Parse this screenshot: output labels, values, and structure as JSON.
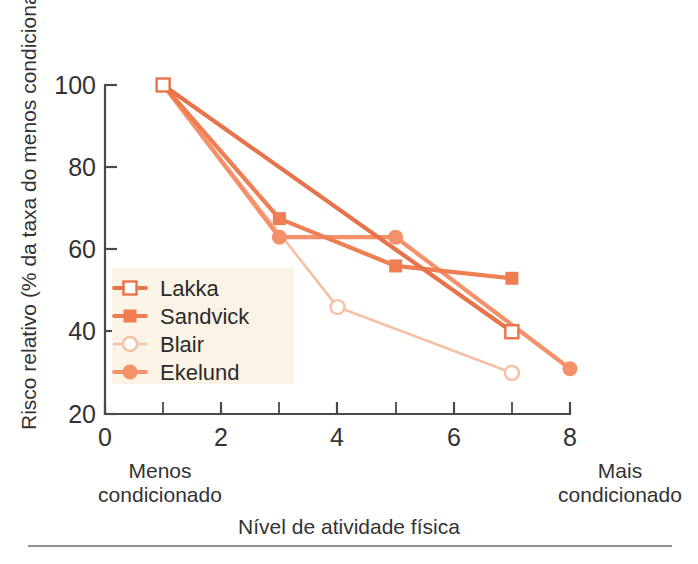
{
  "chart_data": {
    "type": "line",
    "title": "",
    "xlabel": "Nível de atividade física",
    "ylabel": "Risco relativo (% da taxa do menos condicionado)",
    "xlim": [
      0,
      8
    ],
    "ylim": [
      20,
      100
    ],
    "x_ticks": [
      0,
      2,
      4,
      6,
      8
    ],
    "x_tick_labels": [
      "0",
      "2",
      "4",
      "6",
      "8"
    ],
    "x_minor_ticks": [
      1,
      3,
      5,
      7
    ],
    "y_ticks": [
      20,
      40,
      60,
      80,
      100
    ],
    "y_tick_labels": [
      "20",
      "40",
      "60",
      "80",
      "100"
    ],
    "grid": false,
    "legend_position": "lower-left-inside",
    "x_axis_end_labels": {
      "left_line1": "Menos",
      "left_line2": "condicionado",
      "right_line1": "Mais",
      "right_line2": "condicionado"
    },
    "series": [
      {
        "name": "Lakka",
        "marker": "open-square",
        "color": "#e8734a",
        "x": [
          1,
          7
        ],
        "y": [
          100,
          40
        ]
      },
      {
        "name": "Sandvick",
        "marker": "filled-square",
        "color": "#ef7f52",
        "x": [
          1,
          3,
          5,
          7
        ],
        "y": [
          100,
          67.5,
          56,
          53
        ]
      },
      {
        "name": "Blair",
        "marker": "open-circle",
        "color": "#f7c0a3",
        "x": [
          1,
          4,
          7
        ],
        "y": [
          100,
          46,
          30
        ]
      },
      {
        "name": "Ekelund",
        "marker": "filled-circle",
        "color": "#f4906a",
        "x": [
          1,
          3,
          5,
          8
        ],
        "y": [
          100,
          63,
          63,
          31
        ]
      }
    ]
  },
  "legend": {
    "items": [
      {
        "label": "Lakka"
      },
      {
        "label": "Sandvick"
      },
      {
        "label": "Blair"
      },
      {
        "label": "Ekelund"
      }
    ],
    "background_color": "#faf3e6"
  },
  "colors": {
    "lakka": "#e8734a",
    "sandvick": "#ef7f52",
    "blair": "#f7c0a3",
    "ekelund": "#f4906a",
    "axis": "#4a4a4a",
    "text": "#333333",
    "background": "#ffffff"
  }
}
